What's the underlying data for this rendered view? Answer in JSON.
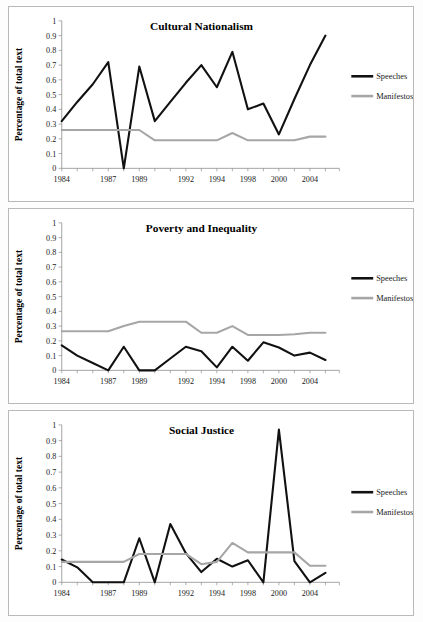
{
  "figure": {
    "y_axis_label": "Percentage of total text",
    "legend": {
      "speeches_label": "Speeches",
      "manifestos_label": "Manifestos",
      "speeches_color": "#111111",
      "manifestos_color": "#a6a6a6"
    },
    "y_ticks": [
      "0",
      "0.1",
      "0.2",
      "0.3",
      "0.4",
      "0.5",
      "0.6",
      "0.7",
      "0.8",
      "0.9",
      "1"
    ],
    "x_tick_labels": [
      "1984",
      "1987",
      "1989",
      "1992",
      "1994",
      "1998",
      "2000",
      "2004"
    ],
    "panel_titles": [
      "Cultural Nationalism",
      "Poverty and Inequality",
      "Social Justice"
    ]
  },
  "chart_data": [
    {
      "type": "line",
      "title": "Cultural Nationalism",
      "xlabel": "",
      "ylabel": "Percentage of total text",
      "ylim": [
        0,
        1
      ],
      "grid": false,
      "legend_position": "right",
      "x": [
        1984,
        1985,
        1986,
        1987,
        1988,
        1989,
        1990,
        1991,
        1992,
        1993,
        1994,
        1996,
        1998,
        1999,
        2000,
        2002,
        2004,
        2005
      ],
      "x_tick_labels": [
        "1984",
        "1987",
        "1989",
        "1992",
        "1994",
        "1998",
        "2000",
        "2004"
      ],
      "series": [
        {
          "name": "Speeches",
          "color": "#111111",
          "values": [
            0.32,
            0.45,
            0.57,
            0.72,
            0.0,
            0.69,
            0.32,
            0.45,
            0.58,
            0.7,
            0.55,
            0.79,
            0.4,
            0.44,
            0.23,
            0.47,
            0.7,
            0.9
          ]
        },
        {
          "name": "Manifestos",
          "color": "#a6a6a6",
          "values": [
            0.26,
            0.26,
            0.26,
            0.26,
            0.26,
            0.26,
            0.19,
            0.19,
            0.19,
            0.19,
            0.19,
            0.24,
            0.19,
            0.19,
            0.19,
            0.19,
            0.215,
            0.215
          ]
        }
      ]
    },
    {
      "type": "line",
      "title": "Poverty and Inequality",
      "xlabel": "",
      "ylabel": "Percentage of total text",
      "ylim": [
        0,
        1
      ],
      "grid": false,
      "legend_position": "right",
      "x": [
        1984,
        1985,
        1986,
        1987,
        1988,
        1989,
        1990,
        1991,
        1992,
        1993,
        1994,
        1996,
        1998,
        1999,
        2000,
        2002,
        2004,
        2005
      ],
      "x_tick_labels": [
        "1984",
        "1987",
        "1989",
        "1992",
        "1994",
        "1998",
        "2000",
        "2004"
      ],
      "series": [
        {
          "name": "Speeches",
          "color": "#111111",
          "values": [
            0.17,
            0.1,
            0.05,
            0.0,
            0.16,
            0.0,
            0.0,
            0.08,
            0.16,
            0.13,
            0.02,
            0.16,
            0.065,
            0.19,
            0.155,
            0.1,
            0.12,
            0.07
          ]
        },
        {
          "name": "Manifestos",
          "color": "#a6a6a6",
          "values": [
            0.265,
            0.265,
            0.265,
            0.265,
            0.3,
            0.33,
            0.33,
            0.33,
            0.33,
            0.255,
            0.255,
            0.3,
            0.24,
            0.24,
            0.24,
            0.245,
            0.255,
            0.255
          ]
        }
      ]
    },
    {
      "type": "line",
      "title": "Social Justice",
      "xlabel": "",
      "ylabel": "Percentage of total text",
      "ylim": [
        0,
        1
      ],
      "grid": false,
      "legend_position": "right",
      "x": [
        1984,
        1985,
        1986,
        1987,
        1988,
        1989,
        1990,
        1991,
        1992,
        1993,
        1994,
        1996,
        1998,
        1999,
        2000,
        2002,
        2004,
        2005
      ],
      "x_tick_labels": [
        "1984",
        "1987",
        "1989",
        "1992",
        "1994",
        "1998",
        "2000",
        "2004"
      ],
      "series": [
        {
          "name": "Speeches",
          "color": "#111111",
          "values": [
            0.145,
            0.095,
            0.0,
            0.0,
            0.0,
            0.28,
            0.0,
            0.37,
            0.185,
            0.065,
            0.15,
            0.1,
            0.14,
            0.0,
            0.97,
            0.135,
            0.0,
            0.06
          ]
        },
        {
          "name": "Manifestos",
          "color": "#a6a6a6",
          "values": [
            0.13,
            0.13,
            0.13,
            0.13,
            0.13,
            0.18,
            0.18,
            0.18,
            0.18,
            0.115,
            0.13,
            0.25,
            0.19,
            0.19,
            0.19,
            0.19,
            0.105,
            0.105
          ]
        }
      ]
    }
  ]
}
